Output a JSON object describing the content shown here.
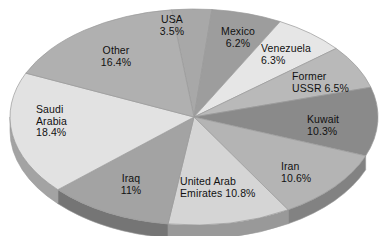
{
  "chart_data": {
    "type": "pie",
    "title": "",
    "subtitle": "",
    "xlabel": "",
    "ylabel": "",
    "legend_position": "none",
    "grid": false,
    "style": "3d-elliptical-pie",
    "start_angle_deg": -7,
    "direction": "clockwise",
    "categories": [
      "USA",
      "Mexico",
      "Venezuela",
      "Former USSR",
      "Kuwait",
      "Iran",
      "United Arab Emirates",
      "Iraq",
      "Saudi Arabia",
      "Other"
    ],
    "values": [
      3.5,
      6.2,
      6.3,
      6.5,
      10.3,
      10.6,
      10.8,
      11,
      18.4,
      16.4
    ],
    "unit": "%",
    "total": 100.0,
    "slices": [
      {
        "name": "USA",
        "value": 3.5,
        "value_label": "3.5%",
        "label_line1": "USA",
        "label_line2": "3.5%",
        "color": "#a8a8a8"
      },
      {
        "name": "Mexico",
        "value": 6.2,
        "value_label": "6.2%",
        "label_line1": "Mexico",
        "label_line2": "6.2%",
        "color": "#9d9d9d"
      },
      {
        "name": "Venezuela",
        "value": 6.3,
        "value_label": "6.3%",
        "label_line1": "Venezuela",
        "label_line2": "6.3%",
        "color": "#e6e6e6"
      },
      {
        "name": "Former USSR",
        "value": 6.5,
        "value_label": "6.5%",
        "label_line1": "Former",
        "label_line2": "USSR 6.5%",
        "color": "#b9b9b9"
      },
      {
        "name": "Kuwait",
        "value": 10.3,
        "value_label": "10.3%",
        "label_line1": "Kuwait",
        "label_line2": "10.3%",
        "color": "#8a8a8a"
      },
      {
        "name": "Iran",
        "value": 10.6,
        "value_label": "10.6%",
        "label_line1": "Iran",
        "label_line2": "10.6%",
        "color": "#b4b4b4"
      },
      {
        "name": "United Arab Emirates",
        "value": 10.8,
        "value_label": "10.8%",
        "label_line1": "United Arab",
        "label_line2": "Emirates 10.8%",
        "color": "#d5d5d5"
      },
      {
        "name": "Iraq",
        "value": 11,
        "value_label": "11%",
        "label_line1": "Iraq",
        "label_line2": "11%",
        "color": "#a3a3a3"
      },
      {
        "name": "Saudi Arabia",
        "value": 18.4,
        "value_label": "18.4%",
        "label_line1": "Saudi",
        "label_line2": "Arabia",
        "label_line3": "18.4%",
        "color": "#e2e2e2"
      },
      {
        "name": "Other",
        "value": 16.4,
        "value_label": "16.4%",
        "label_line1": "Other",
        "label_line2": "16.4%",
        "color": "#b0b0b0"
      }
    ],
    "colors": {
      "background": "#ffffff",
      "text": "#111111",
      "edge": "#9a9a9a",
      "depth_shadow": "#8f8f8f"
    }
  }
}
